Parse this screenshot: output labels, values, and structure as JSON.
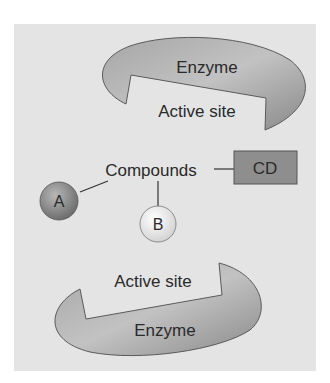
{
  "diagram": {
    "colors": {
      "panel": "#e4e4e4",
      "enzyme_fill": "#9a9a9a",
      "enzyme_stroke": "#5a5a5a",
      "circle_a": "#8c8c8c",
      "circle_b": "#f2f2f2",
      "cd_box": "#8e8e8e",
      "text": "#2a2a2a"
    },
    "top_enzyme": {
      "label": "Enzyme",
      "active_site_label": "Active site"
    },
    "compounds": {
      "label": "Compounds",
      "a_label": "A",
      "b_label": "B",
      "cd_label": "CD"
    },
    "bottom_enzyme": {
      "label": "Enzyme",
      "active_site_label": "Active site"
    }
  }
}
